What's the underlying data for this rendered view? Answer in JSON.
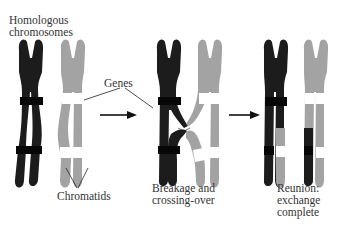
{
  "diagram": {
    "type": "chromosome-crossing-over",
    "colors": {
      "dark_chromosome": "#1c1c1c",
      "dark_band": "#080808",
      "light_chromosome": "#a3a3a3",
      "light_band": "#8e8e8e",
      "gene_band": "#ffffff",
      "arrow": "#111111",
      "text": "#333333"
    },
    "labels": {
      "homologous_line1": "Homologous",
      "homologous_line2": "chromosomes",
      "genes": "Genes",
      "chromatids": "Chromatids",
      "breakage_line1": "Breakage and",
      "breakage_line2": "crossing-over",
      "reunion_line1": "Reunion:",
      "reunion_line2": "exchange",
      "reunion_line3": "complete"
    },
    "stages": [
      {
        "name": "Homologous chromosomes",
        "step": 1
      },
      {
        "name": "Breakage and crossing-over",
        "step": 2
      },
      {
        "name": "Reunion: exchange complete",
        "step": 3
      }
    ],
    "arrows": [
      {
        "from": "stage-1",
        "to": "stage-2"
      },
      {
        "from": "stage-2",
        "to": "stage-3"
      }
    ]
  }
}
